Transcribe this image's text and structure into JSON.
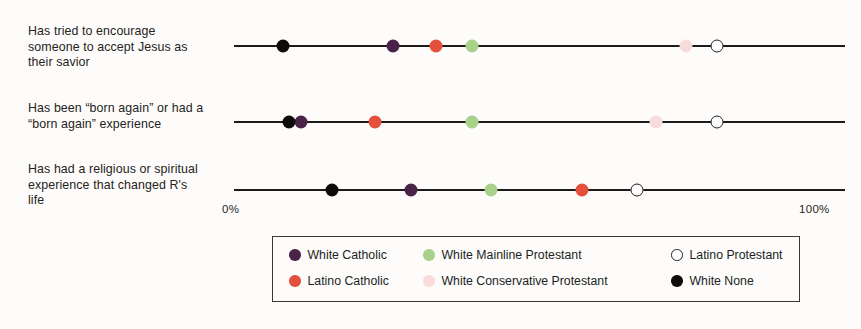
{
  "chart_data": {
    "type": "scatter",
    "title": "",
    "xlabel": "",
    "ylabel": "",
    "xlim": [
      0,
      100
    ],
    "grid": false,
    "legend_position": "bottom",
    "axis_ticks": {
      "min_label": "0%",
      "max_label": "100%"
    },
    "categories": [
      "Has tried to encourage\nsomeone to accept Jesus as\ntheir savior",
      "Has been “born again” or had a\n“born again” experience",
      "Has had a religious or spiritual\nexperience that changed R's\nlife"
    ],
    "series": [
      {
        "name": "White Catholic",
        "color": "#4a2348",
        "style": "filled",
        "values": [
          26,
          11,
          29
        ]
      },
      {
        "name": "Latino Catholic",
        "color": "#e4503c",
        "style": "filled",
        "values": [
          33,
          23,
          57
        ]
      },
      {
        "name": "White Mainline Protestant",
        "color": "#a8d18a",
        "style": "filled",
        "values": [
          39,
          39,
          42
        ]
      },
      {
        "name": "White Conservative Protestant",
        "color": "#fadbdb",
        "style": "filled",
        "values": [
          74,
          69,
          66
        ]
      },
      {
        "name": "Latino Protestant",
        "color": "#ffffff",
        "style": "hollow",
        "values": [
          79,
          79,
          66
        ]
      },
      {
        "name": "White None",
        "color": "#0d0c0b",
        "style": "filled",
        "values": [
          8,
          9,
          16
        ]
      }
    ]
  },
  "legend": {
    "items": [
      {
        "label": "White Catholic",
        "color": "#4a2348",
        "style": "filled"
      },
      {
        "label": "White Mainline Protestant",
        "color": "#a8d18a",
        "style": "filled"
      },
      {
        "label": "Latino Protestant",
        "color": "#ffffff",
        "style": "hollow"
      },
      {
        "label": "Latino Catholic",
        "color": "#e4503c",
        "style": "filled"
      },
      {
        "label": "White Conservative Protestant",
        "color": "#fadbdb",
        "style": "filled"
      },
      {
        "label": "White None",
        "color": "#0d0c0b",
        "style": "filled"
      }
    ]
  }
}
